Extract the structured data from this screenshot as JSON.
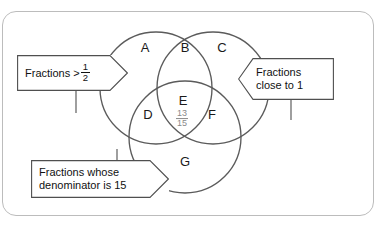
{
  "diagram": {
    "type": "venn",
    "title": "",
    "sets": [
      {
        "id": "A",
        "label": "Fractions > 1/2",
        "position": "top-left"
      },
      {
        "id": "C",
        "label": "Fractions close to 1",
        "position": "top-right"
      },
      {
        "id": "G",
        "label": "Fractions whose denominator is 15",
        "position": "bottom"
      }
    ],
    "regions": [
      {
        "id": "A",
        "letter": "A"
      },
      {
        "id": "B",
        "letter": "B"
      },
      {
        "id": "C",
        "letter": "C"
      },
      {
        "id": "D",
        "letter": "D"
      },
      {
        "id": "E",
        "letter": "E"
      },
      {
        "id": "F",
        "letter": "F"
      },
      {
        "id": "G",
        "letter": "G"
      }
    ],
    "center_value": {
      "numerator": "13",
      "denominator": "15"
    },
    "callouts": {
      "left": {
        "text_before": "Fractions >",
        "fraction_numerator": "1",
        "fraction_denominator": "2"
      },
      "right": {
        "line1": "Fractions",
        "line2": "close to 1"
      },
      "bottom": {
        "line1": "Fractions whose",
        "line2": "denominator is 15"
      }
    },
    "colors": {
      "circle_stroke": "#5b5b5b",
      "frame_stroke": "#bcbcbc",
      "label_text": "#1a1a1a",
      "center_fraction_text": "#8a8a8a",
      "callout_stroke": "#4f4f4f",
      "background": "#ffffff"
    }
  }
}
